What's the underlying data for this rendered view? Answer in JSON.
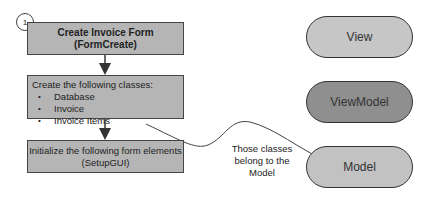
{
  "steps": [
    {
      "number": "1",
      "title": "Create Invoice Form",
      "subtitle": "(FormCreate)"
    },
    {
      "title": "Create the following classes:",
      "items": [
        "Database",
        "Invoice",
        "Invoice Items"
      ]
    },
    {
      "title": "Initialize the following form elements",
      "subtitle": "(SetupGUI)"
    }
  ],
  "layers": [
    {
      "label": "View",
      "color": "#c6c6c6"
    },
    {
      "label": "ViewModel",
      "color": "#8f8f8f"
    },
    {
      "label": "Model",
      "color": "#c2c2c2"
    }
  ],
  "annotation": {
    "line1": "Those classes",
    "line2": "belong to the",
    "line3": "Model"
  }
}
